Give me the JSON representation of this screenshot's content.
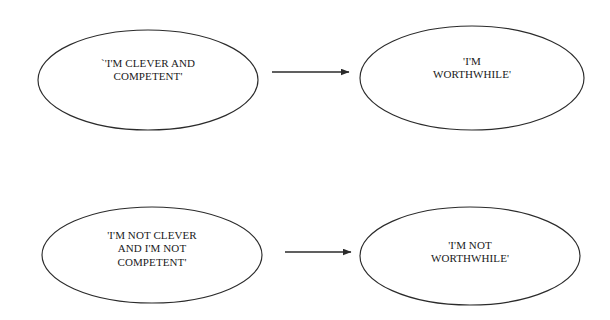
{
  "diagram": {
    "type": "flow-diagram",
    "background_color": "#ffffff",
    "stroke_color": "#2b2b2b",
    "text_color": "#1a1a1a",
    "nodes": [
      {
        "id": "positive-belief",
        "shape": "ellipse",
        "lines": [
          "`'I'M CLEVER AND",
          "COMPETENT'"
        ],
        "cx": 148,
        "cy": 80,
        "rx": 110,
        "ry": 50
      },
      {
        "id": "positive-outcome",
        "shape": "ellipse",
        "lines": [
          "'I'M",
          "WORTHWHILE'"
        ],
        "cx": 472,
        "cy": 78,
        "rx": 112,
        "ry": 52
      },
      {
        "id": "negative-belief",
        "shape": "ellipse",
        "lines": [
          "'I'M NOT CLEVER",
          "AND I'M NOT",
          "COMPETENT'"
        ],
        "cx": 152,
        "cy": 255,
        "rx": 110,
        "ry": 48
      },
      {
        "id": "negative-outcome",
        "shape": "ellipse",
        "lines": [
          "'I'M NOT",
          "WORTHWHILE'"
        ],
        "cx": 470,
        "cy": 256,
        "rx": 110,
        "ry": 49
      }
    ],
    "arrows": [
      {
        "id": "arrow-positive",
        "from": "positive-belief",
        "to": "positive-outcome",
        "x1": 272,
        "y1": 72,
        "x2": 350,
        "y2": 72
      },
      {
        "id": "arrow-negative",
        "from": "negative-belief",
        "to": "negative-outcome",
        "x1": 285,
        "y1": 252,
        "x2": 352,
        "y2": 252
      }
    ]
  }
}
